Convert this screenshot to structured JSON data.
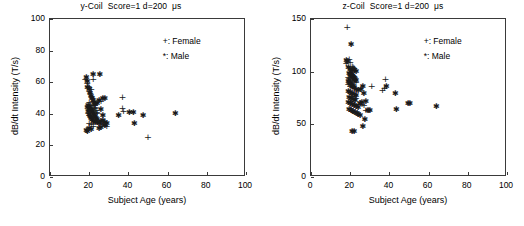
{
  "figure": {
    "background_color": "#ffffff",
    "axis_color": "#3a3a3a",
    "marker_color": "#1a1a1a",
    "width": 524,
    "height": 226
  },
  "panels": [
    {
      "id": "y-coil",
      "title": "y-Coil  Score=1 d=200  μs",
      "legend": [
        {
          "label": "+: Female",
          "marker": "+"
        },
        {
          "label": "*: Male",
          "marker": "*"
        }
      ],
      "box": {
        "left": 49,
        "top": 18,
        "width": 196,
        "height": 158
      }
    },
    {
      "id": "z-coil",
      "title": "z-Coil  Score=1 d=200  μs",
      "legend": [
        {
          "label": "+: Female",
          "marker": "+"
        },
        {
          "label": "*: Male",
          "marker": "*"
        }
      ],
      "box": {
        "left": 48,
        "top": 18,
        "width": 196,
        "height": 158
      }
    }
  ],
  "chart_data": [
    {
      "type": "scatter",
      "title": "y-Coil  Score=1 d=200  μs",
      "xlabel": "Subject Age (years)",
      "ylabel": "dB/dt Intensity (T/s)",
      "xlim": [
        0,
        100
      ],
      "ylim": [
        0,
        100
      ],
      "xticks": [
        0,
        20,
        40,
        60,
        80,
        100
      ],
      "yticks": [
        0,
        20,
        40,
        60,
        80,
        100
      ],
      "grid": false,
      "legend_position": "top-right",
      "series": [
        {
          "name": "Female",
          "marker": "+",
          "points": [
            [
              18.0,
              62.5
            ],
            [
              19.0,
              60.0
            ],
            [
              19.5,
              58.0
            ],
            [
              20.0,
              57.5
            ],
            [
              20.0,
              55.0
            ],
            [
              20.5,
              54.0
            ],
            [
              21.0,
              56.5
            ],
            [
              21.0,
              52.0
            ],
            [
              21.5,
              50.5
            ],
            [
              22.0,
              62.5
            ],
            [
              22.0,
              49.0
            ],
            [
              22.0,
              47.0
            ],
            [
              22.5,
              46.0
            ],
            [
              23.0,
              45.0
            ],
            [
              23.0,
              44.0
            ],
            [
              23.5,
              43.0
            ],
            [
              24.0,
              42.0
            ],
            [
              24.0,
              41.0
            ],
            [
              20.0,
              48.0
            ],
            [
              20.5,
              46.5
            ],
            [
              21.0,
              44.5
            ],
            [
              21.5,
              43.5
            ],
            [
              22.0,
              42.5
            ],
            [
              19.5,
              41.0
            ],
            [
              20.0,
              40.0
            ],
            [
              20.5,
              39.0
            ],
            [
              21.0,
              38.0
            ],
            [
              22.0,
              37.0
            ],
            [
              23.0,
              36.5
            ],
            [
              24.0,
              36.0
            ],
            [
              25.0,
              35.5
            ],
            [
              26.0,
              35.0
            ],
            [
              27.0,
              34.0
            ],
            [
              28.0,
              33.5
            ],
            [
              29.0,
              33.0
            ],
            [
              20.0,
              35.0
            ],
            [
              21.0,
              34.0
            ],
            [
              22.0,
              33.0
            ],
            [
              26.0,
              49.0
            ],
            [
              37.0,
              51.5
            ],
            [
              37.0,
              44.5
            ],
            [
              37.5,
              42.5
            ],
            [
              50.0,
              26.0
            ]
          ]
        },
        {
          "name": "Male",
          "marker": "*",
          "points": [
            [
              18.5,
              63.5
            ],
            [
              19.0,
              61.0
            ],
            [
              22.0,
              65.0
            ],
            [
              25.5,
              65.0
            ],
            [
              19.0,
              57.0
            ],
            [
              20.0,
              55.5
            ],
            [
              20.5,
              53.0
            ],
            [
              21.0,
              51.0
            ],
            [
              21.5,
              50.0
            ],
            [
              22.0,
              48.5
            ],
            [
              22.5,
              47.5
            ],
            [
              23.0,
              46.5
            ],
            [
              19.5,
              45.5
            ],
            [
              20.0,
              44.5
            ],
            [
              20.5,
              43.5
            ],
            [
              21.0,
              42.5
            ],
            [
              21.5,
              41.5
            ],
            [
              22.0,
              40.5
            ],
            [
              22.5,
              39.5
            ],
            [
              23.0,
              38.5
            ],
            [
              23.5,
              37.5
            ],
            [
              24.0,
              36.5
            ],
            [
              19.0,
              44.0
            ],
            [
              19.5,
              42.0
            ],
            [
              20.0,
              40.0
            ],
            [
              20.5,
              38.5
            ],
            [
              21.0,
              37.5
            ],
            [
              21.5,
              36.5
            ],
            [
              22.0,
              35.5
            ],
            [
              23.0,
              35.0
            ],
            [
              24.0,
              34.5
            ],
            [
              25.0,
              34.0
            ],
            [
              26.0,
              35.5
            ],
            [
              27.0,
              36.0
            ],
            [
              28.0,
              34.5
            ],
            [
              29.0,
              34.0
            ],
            [
              18.5,
              30.0
            ],
            [
              19.0,
              29.0
            ],
            [
              20.0,
              31.0
            ],
            [
              21.0,
              30.5
            ],
            [
              25.0,
              31.0
            ],
            [
              26.0,
              31.5
            ],
            [
              24.0,
              47.0
            ],
            [
              25.0,
              49.0
            ],
            [
              27.0,
              50.0
            ],
            [
              28.0,
              50.0
            ],
            [
              26.0,
              43.0
            ],
            [
              27.0,
              39.5
            ],
            [
              28.0,
              33.0
            ],
            [
              35.0,
              39.5
            ],
            [
              40.5,
              41.0
            ],
            [
              42.5,
              41.0
            ],
            [
              43.0,
              34.0
            ],
            [
              47.5,
              39.0
            ],
            [
              64.0,
              40.5
            ]
          ]
        }
      ]
    },
    {
      "type": "scatter",
      "title": "z-Coil  Score=1 d=200  μs",
      "xlabel": "Subject Age (years)",
      "ylabel": "dB/dt Intensity (T/s)",
      "xlim": [
        0,
        100
      ],
      "ylim": [
        0,
        150
      ],
      "xticks": [
        0,
        20,
        40,
        60,
        80,
        100
      ],
      "yticks": [
        0,
        50,
        100,
        150
      ],
      "grid": false,
      "legend_position": "top-right",
      "series": [
        {
          "name": "Female",
          "marker": "+",
          "points": [
            [
              18.5,
              143.0
            ],
            [
              19.5,
              113.0
            ],
            [
              20.0,
              110.0
            ],
            [
              18.0,
              109.5
            ],
            [
              21.0,
              106.5
            ],
            [
              21.5,
              105.0
            ],
            [
              22.0,
              104.0
            ],
            [
              22.5,
              103.0
            ],
            [
              20.0,
              101.0
            ],
            [
              20.5,
              100.0
            ],
            [
              21.0,
              99.0
            ],
            [
              21.5,
              98.0
            ],
            [
              22.0,
              97.0
            ],
            [
              19.0,
              96.0
            ],
            [
              19.5,
              95.0
            ],
            [
              20.0,
              94.0
            ],
            [
              21.0,
              93.0
            ],
            [
              22.0,
              92.0
            ],
            [
              23.0,
              91.0
            ],
            [
              19.0,
              89.0
            ],
            [
              20.0,
              87.5
            ],
            [
              21.0,
              86.0
            ],
            [
              22.0,
              85.0
            ],
            [
              20.0,
              82.0
            ],
            [
              21.0,
              80.0
            ],
            [
              22.0,
              78.0
            ],
            [
              23.0,
              76.0
            ],
            [
              20.0,
              73.0
            ],
            [
              21.0,
              71.0
            ],
            [
              22.0,
              70.0
            ],
            [
              24.0,
              70.0
            ],
            [
              20.0,
              66.0
            ],
            [
              21.0,
              64.0
            ],
            [
              22.0,
              63.0
            ],
            [
              26.0,
              70.0
            ],
            [
              27.0,
              69.0
            ],
            [
              28.0,
              65.0
            ],
            [
              29.5,
              64.5
            ],
            [
              31.0,
              87.0
            ],
            [
              38.0,
              94.0
            ],
            [
              37.5,
              85.0
            ],
            [
              36.5,
              84.0
            ]
          ]
        },
        {
          "name": "Male",
          "marker": "*",
          "points": [
            [
              20.5,
              126.0
            ],
            [
              18.0,
              111.5
            ],
            [
              18.5,
              110.0
            ],
            [
              19.0,
              104.5
            ],
            [
              20.0,
              103.0
            ],
            [
              21.0,
              102.0
            ],
            [
              22.0,
              101.5
            ],
            [
              23.0,
              100.5
            ],
            [
              19.5,
              99.0
            ],
            [
              20.0,
              98.0
            ],
            [
              20.5,
              97.0
            ],
            [
              21.0,
              96.0
            ],
            [
              21.5,
              95.0
            ],
            [
              22.0,
              94.0
            ],
            [
              22.5,
              93.0
            ],
            [
              23.0,
              92.0
            ],
            [
              19.0,
              91.0
            ],
            [
              19.5,
              90.0
            ],
            [
              20.0,
              89.0
            ],
            [
              20.5,
              88.0
            ],
            [
              21.0,
              87.0
            ],
            [
              21.5,
              86.0
            ],
            [
              22.0,
              85.0
            ],
            [
              23.0,
              84.0
            ],
            [
              24.0,
              83.0
            ],
            [
              19.0,
              82.0
            ],
            [
              20.0,
              81.0
            ],
            [
              21.0,
              80.0
            ],
            [
              22.0,
              79.0
            ],
            [
              23.0,
              78.0
            ],
            [
              19.5,
              76.0
            ],
            [
              20.5,
              75.0
            ],
            [
              21.5,
              74.0
            ],
            [
              22.5,
              73.0
            ],
            [
              19.0,
              71.0
            ],
            [
              20.0,
              70.0
            ],
            [
              21.0,
              69.0
            ],
            [
              22.0,
              68.0
            ],
            [
              23.0,
              67.0
            ],
            [
              24.0,
              66.0
            ],
            [
              19.5,
              65.0
            ],
            [
              20.5,
              64.0
            ],
            [
              21.5,
              63.0
            ],
            [
              22.5,
              62.0
            ],
            [
              23.5,
              61.0
            ],
            [
              25.0,
              70.5
            ],
            [
              26.0,
              71.0
            ],
            [
              25.5,
              84.0
            ],
            [
              26.5,
              86.0
            ],
            [
              27.0,
              80.0
            ],
            [
              28.0,
              72.0
            ],
            [
              29.0,
              64.0
            ],
            [
              30.0,
              63.5
            ],
            [
              27.5,
              55.0
            ],
            [
              26.5,
              48.0
            ],
            [
              21.0,
              44.0
            ],
            [
              22.0,
              43.5
            ],
            [
              24.0,
              60.0
            ],
            [
              25.0,
              59.0
            ],
            [
              38.5,
              86.0
            ],
            [
              43.0,
              80.0
            ],
            [
              43.5,
              64.5
            ],
            [
              49.5,
              70.0
            ],
            [
              50.5,
              70.0
            ],
            [
              64.0,
              67.0
            ]
          ]
        }
      ]
    }
  ]
}
